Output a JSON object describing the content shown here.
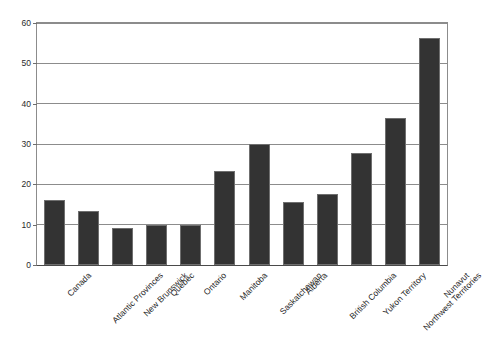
{
  "chart_data": {
    "type": "bar",
    "title": "",
    "subtitle": "",
    "xlabel": "",
    "ylabel": "",
    "ylim": [
      0,
      60
    ],
    "yticks": [
      0,
      10,
      20,
      30,
      40,
      50,
      60
    ],
    "grid": "horizontal",
    "legend": "none",
    "bar_color": "#333333",
    "bar_edge_color": "#6f6f6f",
    "background_color": "#ffffff",
    "gridline_color": "#8c8c8c",
    "categories": [
      "Canada",
      "Atlantic Provinces",
      "New Brunswick",
      "Quebec",
      "Ontario",
      "Manitoba",
      "Saskatchewan",
      "Alberta",
      "British Columbia",
      "Yukon Territory",
      "Northwest Territories",
      "Nunavut"
    ],
    "values": [
      16.2,
      13.5,
      9.3,
      10.0,
      10.0,
      23.3,
      30.0,
      15.5,
      17.5,
      27.8,
      36.4,
      56.2
    ]
  }
}
